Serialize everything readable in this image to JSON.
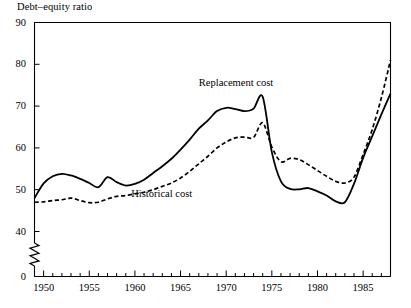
{
  "chart_data": {
    "type": "line",
    "title": "Debt–equity ratio",
    "xlabel": "",
    "ylabel": "Debt–equity ratio",
    "xlim": [
      1949,
      1988
    ],
    "ylim": [
      40,
      90
    ],
    "y_axis_break": true,
    "y_break_from": 0,
    "y_break_to": 40,
    "grid": false,
    "legend_position": "inline-annotations",
    "yticks": [
      0,
      40,
      50,
      60,
      70,
      80,
      90
    ],
    "ytick_labels": [
      "0",
      "40",
      "50",
      "60",
      "70",
      "80",
      "90"
    ],
    "xticks": [
      1950,
      1955,
      1960,
      1965,
      1970,
      1975,
      1980,
      1985
    ],
    "xtick_labels": [
      "1950",
      "1955",
      "1960",
      "1965",
      "1970",
      "1975",
      "1980",
      "1985"
    ],
    "x_minor_tick_interval": 1,
    "x": [
      1949,
      1950,
      1951,
      1952,
      1953,
      1954,
      1955,
      1956,
      1957,
      1958,
      1959,
      1960,
      1961,
      1962,
      1963,
      1964,
      1965,
      1966,
      1967,
      1968,
      1969,
      1970,
      1971,
      1972,
      1973,
      1974,
      1975,
      1976,
      1977,
      1978,
      1979,
      1980,
      1981,
      1982,
      1983,
      1984,
      1985,
      1986,
      1987,
      1988
    ],
    "series": [
      {
        "name": "Replacement cost",
        "style": "solid",
        "color": "#000000",
        "values": [
          48.0,
          51.5,
          53.2,
          53.8,
          53.4,
          52.6,
          51.6,
          50.6,
          53.0,
          51.8,
          51.0,
          51.4,
          52.4,
          54.0,
          55.6,
          57.4,
          59.6,
          62.0,
          64.6,
          66.6,
          68.8,
          69.6,
          69.3,
          68.8,
          69.4,
          72.2,
          59.0,
          52.0,
          50.2,
          50.1,
          50.4,
          49.6,
          48.6,
          47.2,
          47.0,
          51.4,
          57.6,
          62.8,
          68.0,
          73.0
        ]
      },
      {
        "name": "Historical cost",
        "style": "dashed",
        "color": "#000000",
        "values": [
          47.0,
          47.1,
          47.4,
          47.6,
          48.0,
          47.4,
          46.9,
          47.0,
          47.8,
          48.4,
          48.6,
          49.0,
          49.4,
          50.0,
          50.8,
          51.6,
          52.8,
          54.4,
          56.2,
          58.0,
          60.0,
          61.4,
          62.4,
          62.6,
          62.5,
          66.0,
          60.2,
          56.7,
          57.5,
          57.2,
          56.0,
          54.6,
          53.2,
          52.0,
          51.6,
          53.0,
          58.4,
          64.4,
          72.0,
          81.0
        ]
      }
    ],
    "annotations": [
      {
        "text": "Replacement cost",
        "x": 1967.0,
        "y": 75.5
      },
      {
        "text": "Historical cost",
        "x": 1959.6,
        "y": 48.9
      }
    ]
  }
}
